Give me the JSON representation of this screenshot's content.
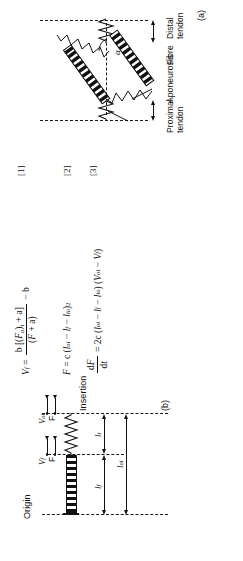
{
  "figure": {
    "orientation": "rotated-90-ccw",
    "panels": [
      {
        "tag": "(b)",
        "name": "lumped-muscle-tendon-model"
      },
      {
        "tag": "(a)",
        "name": "pennate-muscle-architecture"
      }
    ]
  },
  "equations": [
    {
      "number": "[1]",
      "lhs": "V",
      "lhs_sub": "f",
      "numerator": "b [(F",
      "numerator_sub": "o",
      "numerator_mid": ")",
      "numerator_sub2": "i",
      "numerator_end": " + a]",
      "denominator": "(F + a)",
      "tail": "− b",
      "plain": "V_f = b[(F_o)_i + a] / (F + a) − b"
    },
    {
      "number": "[2]",
      "plain": "F = c (l_oi − l_f − l_to)²",
      "lhs": "F",
      "rhs_coef": "c",
      "term1": "l",
      "term1_sub": "oi",
      "term2": "l",
      "term2_sub": "f",
      "term3": "l",
      "term3_sub": "to",
      "power": "2"
    },
    {
      "number": "[3]",
      "plain": "dF/dt = 2c (l_oi − l_f − l_to) (V_oi − V_f)",
      "lhs_num": "dF",
      "lhs_den": "dt",
      "rhs_coef": "2c",
      "term1": "l",
      "term1_sub": "oi",
      "term2": "l",
      "term2_sub": "f",
      "term3": "l",
      "term3_sub": "to",
      "term4": "V",
      "term4_sub": "oi",
      "term5": "V",
      "term5_sub": "f"
    }
  ],
  "panel_b": {
    "tag": "(b)",
    "origin_label": "Origin",
    "insertion_label": "Insertion",
    "dim_fibre": "l",
    "dim_fibre_sub": "f",
    "dim_tendon": "l",
    "dim_tendon_sub": "t",
    "dim_total": "l",
    "dim_total_sub": "oi",
    "force_label": "F",
    "velocity_fibre": "V",
    "velocity_fibre_sub": "f",
    "velocity_origin": "V",
    "velocity_origin_sub": "oi"
  },
  "panel_a": {
    "tag": "(a)",
    "proximal_tendon": "Proximal\ntendon",
    "aponeurosis": "Aponeurosis",
    "fibre": "Fibre",
    "distal_tendon": "Distal\ntendon",
    "pennation_angle": "α"
  },
  "colors": {
    "ink": "#111111",
    "paper": "#ffffff"
  }
}
